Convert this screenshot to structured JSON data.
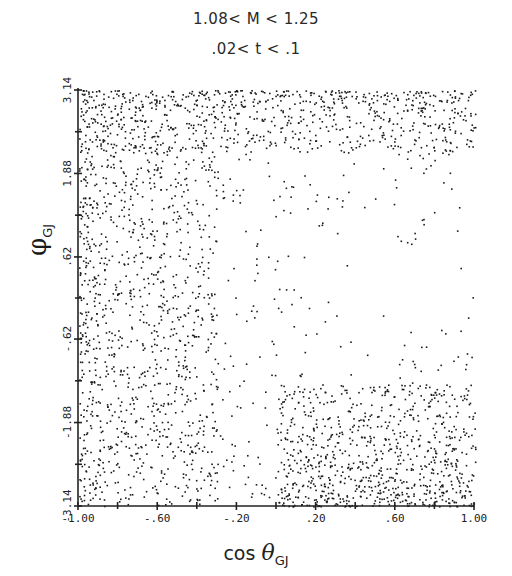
{
  "chart_data": {
    "type": "scatter",
    "title_lines": [
      "1.08< M < 1.25",
      ".02< t < .1"
    ],
    "xlabel": "cos θ",
    "xlabel_subscript": "GJ",
    "ylabel": "φ",
    "ylabel_subscript": "GJ",
    "xlim": [
      -1.0,
      1.0
    ],
    "ylim": [
      -3.14,
      3.14
    ],
    "x_ticks": [
      -1.0,
      -0.6,
      -0.2,
      0.2,
      0.6,
      1.0
    ],
    "x_tick_labels": [
      "-1.00",
      "-.60",
      "-.20",
      ".20",
      ".60",
      "1.00"
    ],
    "y_ticks": [
      3.14,
      1.88,
      0.62,
      -0.62,
      -1.88,
      -3.14
    ],
    "y_tick_labels": [
      "3.14",
      "1.88",
      ".62",
      "-.62",
      "-1.88",
      "-3.14"
    ],
    "grid": false,
    "legend": null,
    "marker_color": "#1a1a1a",
    "point_count_approx": 3000,
    "density_description": "Dense along top band (phi near 3.14), left side (cos θ < -0.3), and bottom-right (phi < -1.5, cos θ > 0.2); sparse region center-right around cos θ 0.2–0.9, phi -0.6–1.2",
    "density_regions": [
      {
        "name": "top-band",
        "x": [
          -1.0,
          1.0
        ],
        "y": [
          2.2,
          3.14
        ],
        "weight": 0.22
      },
      {
        "name": "left-side",
        "x": [
          -1.0,
          -0.3
        ],
        "y": [
          -3.14,
          3.14
        ],
        "weight": 0.33
      },
      {
        "name": "bottom-right",
        "x": [
          0.0,
          1.0
        ],
        "y": [
          -3.14,
          -1.3
        ],
        "weight": 0.22
      },
      {
        "name": "background",
        "x": [
          -1.0,
          1.0
        ],
        "y": [
          -3.14,
          3.14
        ],
        "weight": 0.23
      }
    ],
    "sparse_hole": {
      "x_center": 0.55,
      "y_center": 0.3,
      "x_radius": 0.45,
      "y_radius": 1.1
    }
  },
  "labels": {
    "title1": "1.08< M < 1.25",
    "title2": ".02< t < .1",
    "xlabel_main": "cos ",
    "xlabel_theta": "θ",
    "xlabel_sub": "GJ",
    "ylabel_main": "φ",
    "ylabel_sub": "GJ"
  }
}
